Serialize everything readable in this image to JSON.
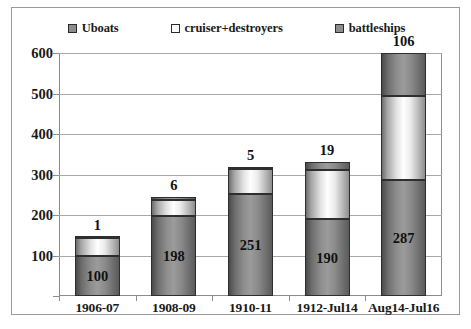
{
  "chart_data": {
    "type": "bar",
    "subtype": "stacked-column",
    "title": "",
    "xlabel": "",
    "ylabel": "",
    "ylim": [
      0,
      600
    ],
    "yticks": [
      100,
      200,
      300,
      400,
      500,
      600
    ],
    "grid": true,
    "legend_position": "top",
    "categories": [
      "1906-07",
      "1908-09",
      "1910-11",
      "1912-Jul14",
      "Aug14-Jul16"
    ],
    "series": [
      {
        "name": "Uboats",
        "color": "#8d8d8d",
        "values": [
          100,
          198,
          251,
          190,
          287
        ]
      },
      {
        "name": "cruiser+destroyers",
        "color": "#ffffff",
        "values": [
          44,
          40,
          62,
          121,
          208
        ]
      },
      {
        "name": "battleships",
        "color": "#8d8d8d",
        "values": [
          1,
          6,
          5,
          19,
          106
        ]
      }
    ],
    "bar_value_labels": [
      "100",
      "198",
      "251",
      "190",
      "287"
    ],
    "bar_top_labels": [
      "1",
      "6",
      "5",
      "19",
      "106"
    ]
  },
  "legend": {
    "items": [
      {
        "label": "Uboats",
        "swatch": "#8d8d8d",
        "icon": "legend-swatch-icon"
      },
      {
        "label": "cruiser+destroyers",
        "swatch": "#fbfbfb",
        "icon": "legend-swatch-icon"
      },
      {
        "label": "battleships",
        "swatch": "#8d8d8d",
        "icon": "legend-swatch-icon"
      }
    ]
  },
  "axis": {
    "y_labels": [
      "600",
      "500",
      "400",
      "300",
      "200",
      "100"
    ],
    "x_labels": [
      "1906-07",
      "1908-09",
      "1910-11",
      "1912-Jul14",
      "Aug14-Jul16"
    ]
  }
}
